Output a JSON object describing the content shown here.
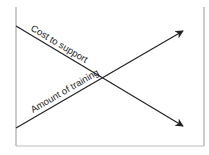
{
  "diagram": {
    "type": "crossing-trend-lines",
    "lines": [
      {
        "label": "Cost to support",
        "direction": "decreasing",
        "color": "#222222"
      },
      {
        "label": "Amount of training",
        "direction": "increasing",
        "color": "#222222"
      }
    ],
    "frame_color": "#aaaaaa"
  }
}
